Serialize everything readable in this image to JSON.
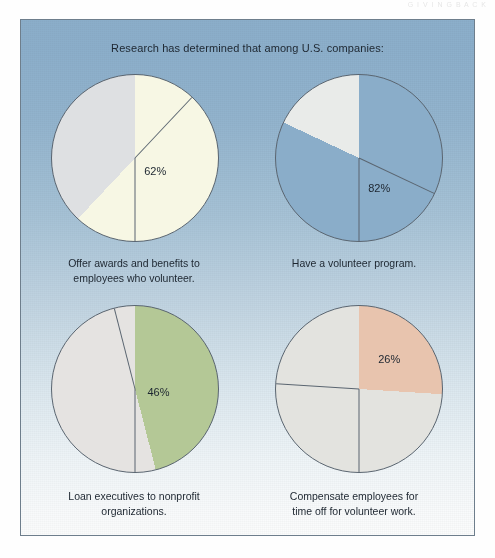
{
  "running_head": "G I V I N G   B A C K",
  "panel": {
    "title": "Research has determined that among U.S. companies:",
    "background_top_color": "#8cafcb",
    "background_bottom_color": "#fbfcfc",
    "border_color": "#6e7e8c"
  },
  "chart_data": {
    "type": "pie",
    "title": "Research has determined that among U.S. companies:",
    "layout": "2x2 grid of pie charts",
    "legend": "none",
    "charts": [
      {
        "id": "pie-awards-benefits",
        "caption_lines": [
          "Offer awards and benefits to",
          "employees who volunteer."
        ],
        "caption": "Offer awards and benefits to employees who volunteer.",
        "label": "62%",
        "slices": [
          {
            "name": "Yes",
            "value": 62,
            "color": "#f7f7e4"
          },
          {
            "name": "Other",
            "value": 38,
            "color": "#dee0e2"
          }
        ],
        "start_angle_deg": 0,
        "label_pos": {
          "x": 62,
          "y": 58
        }
      },
      {
        "id": "pie-volunteer-program",
        "caption_lines": [
          "Have a volunteer program."
        ],
        "caption": "Have a volunteer program.",
        "label": "82%",
        "slices": [
          {
            "name": "Yes",
            "value": 82,
            "color": "#8aadc9"
          },
          {
            "name": "Other",
            "value": 18,
            "color": "#e9ebe9"
          }
        ],
        "start_angle_deg": 0,
        "label_pos": {
          "x": 62,
          "y": 68
        }
      },
      {
        "id": "pie-loan-executives",
        "caption_lines": [
          "Loan executives to nonprofit organizations."
        ],
        "caption": "Loan executives to nonprofit organizations.",
        "label": "46%",
        "slices": [
          {
            "name": "Yes",
            "value": 46,
            "color": "#b4c896"
          },
          {
            "name": "Other",
            "value": 54,
            "color": "#e5e3e1"
          }
        ],
        "start_angle_deg": 0,
        "label_pos": {
          "x": 64,
          "y": 52
        }
      },
      {
        "id": "pie-compensate-time-off",
        "caption_lines": [
          "Compensate employees for",
          "time off for volunteer work."
        ],
        "caption": "Compensate employees for time off for volunteer work.",
        "label": "26%",
        "slices": [
          {
            "name": "Yes",
            "value": 26,
            "color": "#e8c4ae"
          },
          {
            "name": "Other",
            "value": 74,
            "color": "#e3e3df"
          }
        ],
        "start_angle_deg": 0,
        "label_pos": {
          "x": 68,
          "y": 32
        }
      }
    ]
  }
}
